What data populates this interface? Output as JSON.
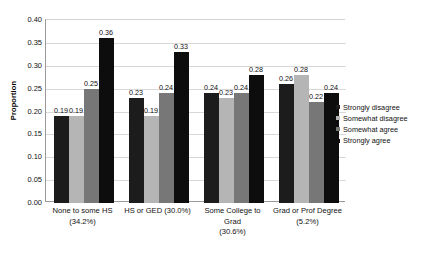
{
  "chart_data": {
    "type": "bar",
    "title": "",
    "xlabel": "",
    "ylabel": "Proportion",
    "ylim": [
      0.0,
      0.4
    ],
    "grid": true,
    "legend_position": "right",
    "categories": [
      "None to some HS (34.2%)",
      "HS or GED (30.0%)",
      "Some College to Grad (30.6%)",
      "Grad or Prof Degree (5.2%)"
    ],
    "category_lines": [
      [
        "None to some HS",
        "(34.2%)"
      ],
      [
        "HS or GED (30.0%)",
        ""
      ],
      [
        "Some College to Grad",
        "(30.6%)"
      ],
      [
        "Grad or Prof Degree",
        "(5.2%)"
      ]
    ],
    "ytick_labels": [
      "0.40",
      "0.35",
      "0.30",
      "0.25",
      "0.20",
      "0.15",
      "0.10",
      "0.05",
      "0.00"
    ],
    "ytick_values": [
      0.4,
      0.35,
      0.3,
      0.25,
      0.2,
      0.15,
      0.1,
      0.05,
      0.0
    ],
    "series": [
      {
        "name": "Strongly disagree",
        "color": "#1c1c1c",
        "values": [
          0.19,
          0.23,
          0.24,
          0.26
        ],
        "labels": [
          "0.19",
          "0.23",
          "0.24",
          "0.26"
        ]
      },
      {
        "name": "Somewhat disagree",
        "color": "#b5b5b5",
        "values": [
          0.19,
          0.19,
          0.23,
          0.28
        ],
        "labels": [
          "0.19",
          "0.19",
          "0.23",
          "0.28"
        ]
      },
      {
        "name": "Somewhat agree",
        "color": "#777777",
        "values": [
          0.25,
          0.24,
          0.24,
          0.22
        ],
        "labels": [
          "0.25",
          "0.24",
          "0.24",
          "0.22"
        ]
      },
      {
        "name": "Strongly agree",
        "color": "#0d0d0d",
        "values": [
          0.36,
          0.33,
          0.28,
          0.24
        ],
        "labels": [
          "0.36",
          "0.33",
          "0.28",
          "0.24"
        ]
      }
    ]
  }
}
